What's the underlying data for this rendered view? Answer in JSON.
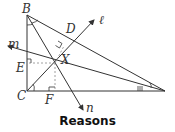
{
  "figure": {
    "points": {
      "B": "B",
      "C": "C",
      "D": "D",
      "E": "E",
      "F": "F",
      "X": "X"
    },
    "lines": {
      "l": "ℓ",
      "m": "m",
      "n": "n"
    },
    "colors": {
      "stroke": "#333333",
      "dashed": "#888888"
    }
  },
  "caption": "Reasons"
}
